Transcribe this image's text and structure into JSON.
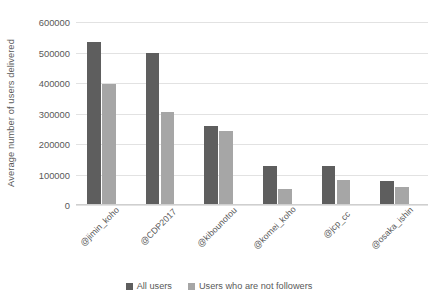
{
  "chart_data": {
    "type": "bar",
    "title": "",
    "subtitle": "",
    "xlabel": "",
    "ylabel": "Average number of users delivered",
    "ylim": [
      0,
      600000
    ],
    "ytick_step": 100000,
    "yticks": [
      "600000",
      "500000",
      "400000",
      "300000",
      "200000",
      "100000",
      "0"
    ],
    "ytick_values": [
      600000,
      500000,
      400000,
      300000,
      200000,
      100000,
      0
    ],
    "grid": true,
    "grid_axis": "y",
    "legend_position": "bottom",
    "categories": [
      "@jimin_koho",
      "@CDP2017",
      "@kibounotou",
      "@komei_koho",
      "@jcp_cc",
      "@osaka_ishin"
    ],
    "series": [
      {
        "name": "All users",
        "color": "#5e5e5e",
        "values": [
          533000,
          498000,
          259000,
          128000,
          127000,
          79000
        ]
      },
      {
        "name": "Users who are not followers",
        "color": "#a6a6a6",
        "values": [
          398000,
          304000,
          243000,
          52000,
          82000,
          60000
        ]
      }
    ]
  },
  "legend": {
    "items": [
      {
        "label": "All users",
        "swatch": "series-0-swatch"
      },
      {
        "label": "Users who are not followers",
        "swatch": "series-1-swatch"
      }
    ]
  }
}
